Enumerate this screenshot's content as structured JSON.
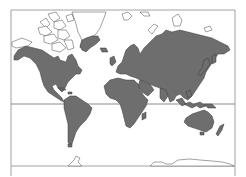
{
  "map": {
    "type": "world-map",
    "projection": "mercator",
    "colors": {
      "background": "#ffffff",
      "land_fill": "#6e6e6e",
      "land_stroke": "#3a3a3a",
      "outline_only_stroke": "#555555",
      "frame": "#8a8a8a",
      "equator": "#5a5a5a"
    },
    "frame": {
      "left": 11,
      "top": 10,
      "right": 235,
      "bottom_line": 166,
      "side_extent": 176
    },
    "equator_y": 104,
    "shaded_regions": [
      "North America",
      "South America",
      "Europe",
      "Africa",
      "Asia",
      "Australia",
      "New Zealand",
      "Japan",
      "Madagascar",
      "Indonesia",
      "Southern Greenland",
      "Iceland",
      "British Isles"
    ],
    "outline_regions": [
      "Canadian Arctic Archipelago",
      "Greenland",
      "Svalbard",
      "Franz Josef Land",
      "Novaya Zemlya",
      "Severnaya Zemlya",
      "Antarctica coastline"
    ],
    "lines": [
      "equator"
    ]
  }
}
